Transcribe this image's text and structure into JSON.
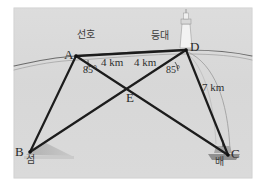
{
  "figure": {
    "kind": "geometry-diagram",
    "panel": {
      "background_color": "#d9d9d9",
      "page_color": "#ffffff",
      "border_color": "#cfcfcf"
    },
    "ink_color": "#1c1c1c",
    "coastline_color": "#5a5a5a",
    "arc_color": "#9a9a9a",
    "island_color": "#b4b4b4",
    "points": [
      {
        "id": "A",
        "label": "A",
        "x": 76,
        "y": 56
      },
      {
        "id": "D",
        "label": "D",
        "x": 186,
        "y": 50
      },
      {
        "id": "B",
        "label": "B",
        "x": 30,
        "y": 152
      },
      {
        "id": "C",
        "label": "C",
        "x": 228,
        "y": 155
      },
      {
        "id": "E",
        "label": "E",
        "x": 131,
        "y": 94
      }
    ],
    "point_labels": [
      {
        "name": "point-label-a",
        "text": "A",
        "x": 65,
        "y": 50
      },
      {
        "name": "point-label-d",
        "text": "D",
        "x": 192,
        "y": 42
      },
      {
        "name": "point-label-b",
        "text": "B",
        "x": 16,
        "y": 147
      },
      {
        "name": "point-label-c",
        "text": "C",
        "x": 232,
        "y": 148
      },
      {
        "name": "point-label-e",
        "text": "E",
        "x": 127,
        "y": 97
      }
    ],
    "korean_labels": [
      {
        "name": "ship-name-label",
        "text": "선호",
        "x": 77,
        "y": 36
      },
      {
        "name": "lighthouse-label",
        "text": "등대",
        "x": 153,
        "y": 37
      },
      {
        "name": "island-label",
        "text": "섬",
        "x": 28,
        "y": 159
      },
      {
        "name": "boat-label",
        "text": "배",
        "x": 219,
        "y": 161
      }
    ],
    "dimension_labels": [
      {
        "name": "segment-length-ae",
        "text": "4 km",
        "x": 104,
        "y": 62
      },
      {
        "name": "segment-length-de",
        "text": "4 km",
        "x": 138,
        "y": 62
      },
      {
        "name": "segment-length-dc",
        "text": "7 km",
        "x": 205,
        "y": 86
      }
    ],
    "angle_labels": [
      {
        "name": "angle-at-a",
        "text": "85°",
        "x": 85,
        "y": 70
      },
      {
        "name": "angle-at-d",
        "text": "85°",
        "x": 168,
        "y": 70
      }
    ],
    "segments": [
      {
        "name": "segment-a-d",
        "from": "A",
        "to": "D",
        "weight": 2.6
      },
      {
        "name": "segment-a-b",
        "from": "A",
        "to": "B",
        "weight": 2.2
      },
      {
        "name": "segment-a-c",
        "from": "A",
        "to": "C",
        "weight": 2.2
      },
      {
        "name": "segment-d-b",
        "from": "D",
        "to": "B",
        "weight": 2.2
      },
      {
        "name": "segment-d-c",
        "from": "D",
        "to": "C",
        "weight": 2.2
      }
    ],
    "icons": {
      "lighthouse": {
        "name": "lighthouse-icon",
        "x": 181,
        "y": 12
      },
      "island": {
        "name": "island-icon",
        "x": 30,
        "y": 148
      },
      "boat": {
        "name": "boat-icon",
        "x": 220,
        "y": 150
      }
    }
  }
}
